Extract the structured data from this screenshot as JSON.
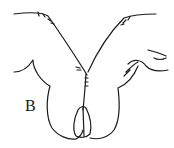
{
  "figure": {
    "panel_label": "B",
    "stroke_color": "#1a1a1a",
    "background_color": "#ffffff"
  }
}
